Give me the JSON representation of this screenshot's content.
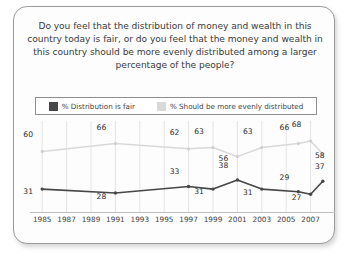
{
  "card": {
    "title": "Do you feel that the distribution of money and wealth in this country today is fair, or do you feel that the money and wealth in this country should be more evenly distributed among a larger percentage of the people?"
  },
  "colors": {
    "series_fair": "#474747",
    "series_even": "#d9d9d9",
    "grid": "#e4e4e4",
    "axis": "#bdbdbd",
    "card_border": "#9b9b9b",
    "text": "#3b3b3b"
  },
  "chart_data": {
    "type": "line",
    "title": "Do you feel that the distribution of money and wealth in this country today is fair, or do you feel that the money and wealth in this country should be more evenly distributed among a larger percentage of the people?",
    "xlabel": "",
    "ylabel": "",
    "ylim": [
      0,
      100
    ],
    "xlim": [
      1984,
      2009
    ],
    "grid": true,
    "legend_position": "top",
    "tick_labels": [
      "1985",
      "1987",
      "1989",
      "1991",
      "1993",
      "1995",
      "1997",
      "1999",
      "2001",
      "2003",
      "2005",
      "2007"
    ],
    "tick_values": [
      1985,
      1987,
      1989,
      1991,
      1993,
      1995,
      1997,
      1999,
      2001,
      2003,
      2005,
      2007
    ],
    "x": [
      1985,
      1991,
      1997,
      1999,
      2001,
      2003,
      2006,
      2007,
      2008
    ],
    "series": [
      {
        "name": "% Should be more evenly distributed",
        "color": "#d9d9d9",
        "values": [
          60,
          66,
          62,
          63,
          56,
          63,
          66,
          68,
          58
        ]
      },
      {
        "name": "% Distribution is fair",
        "color": "#474747",
        "values": [
          31,
          28,
          33,
          31,
          38,
          31,
          29,
          27,
          37
        ]
      }
    ]
  },
  "legend": {
    "entries": [
      {
        "label": "% Distribution is fair",
        "swatch": "dark"
      },
      {
        "label": "% Should be more evenly distributed",
        "swatch": "light"
      }
    ]
  }
}
